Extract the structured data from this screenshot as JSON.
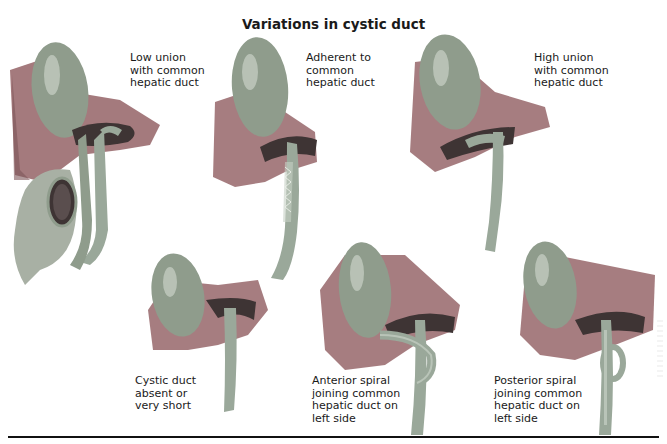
{
  "title": "Variations in cystic duct",
  "colors": {
    "gallbladder": "#8f9c8c",
    "gallbladder_highlight": "#c9d2c6",
    "liver": "#9c6f72",
    "liver_dark": "#7d5558",
    "duct": "#9aa89a",
    "duct_highlight": "#c6d0c4",
    "duodenum": "#a8b0a4",
    "cut_surface": "#3e3434",
    "text": "#1a1a1a",
    "divider": "#111111"
  },
  "panels": [
    {
      "id": "low-union",
      "label": "Low union\nwith common\nhepatic duct",
      "row": "top",
      "position": 1
    },
    {
      "id": "adherent",
      "label": "Adherent to\ncommon\nhepatic duct",
      "row": "top",
      "position": 2
    },
    {
      "id": "high-union",
      "label": "High union\nwith common\nhepatic duct",
      "row": "top",
      "position": 3
    },
    {
      "id": "absent-short",
      "label": "Cystic duct\nabsent or\nvery short",
      "row": "bottom",
      "position": 1
    },
    {
      "id": "anterior-spiral",
      "label": "Anterior spiral\njoining common\nhepatic duct on\nleft side",
      "row": "bottom",
      "position": 2
    },
    {
      "id": "posterior-spiral",
      "label": "Posterior spiral\njoining common\nhepatic duct on\nleft side",
      "row": "bottom",
      "position": 3
    }
  ]
}
